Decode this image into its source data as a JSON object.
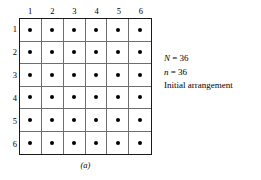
{
  "figure": {
    "caption": "(a)",
    "grid": {
      "rows": 6,
      "cols": 6,
      "column_headers": [
        "1",
        "2",
        "3",
        "4",
        "5",
        "6"
      ],
      "row_headers": [
        "1",
        "2",
        "3",
        "4",
        "5",
        "6"
      ],
      "cells": [
        [
          1,
          1,
          1,
          1,
          1,
          1
        ],
        [
          1,
          1,
          1,
          1,
          1,
          1
        ],
        [
          1,
          1,
          1,
          1,
          1,
          1
        ],
        [
          1,
          1,
          1,
          1,
          1,
          1
        ],
        [
          1,
          1,
          1,
          1,
          1,
          1
        ],
        [
          1,
          1,
          1,
          1,
          1,
          1
        ]
      ],
      "marker": "filled-dot",
      "marker_color": "#000000",
      "line_color": "#6e6e6e",
      "border_color": "#1a1a1a",
      "background": "#ffffff"
    },
    "annotations": [
      {
        "symbol": "N",
        "relation": " = ",
        "value": "36",
        "text": "N = 36"
      },
      {
        "symbol": "n",
        "relation": " = ",
        "value": "36",
        "text": "n = 36"
      },
      {
        "symbol": "",
        "relation": "",
        "value": "",
        "text": "Initial arrangement"
      }
    ]
  },
  "chart_data": {
    "type": "scatter",
    "title": "",
    "subtitle": "",
    "xlabel": "",
    "ylabel": "",
    "xticks": [
      "1",
      "2",
      "3",
      "4",
      "5",
      "6"
    ],
    "yticks": [
      "1",
      "2",
      "3",
      "4",
      "5",
      "6"
    ],
    "xlim": [
      0.5,
      6.5
    ],
    "ylim": [
      6.5,
      0.5
    ],
    "grid": true,
    "legend": "none",
    "points": [
      {
        "x": 1,
        "y": 1
      },
      {
        "x": 2,
        "y": 1
      },
      {
        "x": 3,
        "y": 1
      },
      {
        "x": 4,
        "y": 1
      },
      {
        "x": 5,
        "y": 1
      },
      {
        "x": 6,
        "y": 1
      },
      {
        "x": 1,
        "y": 2
      },
      {
        "x": 2,
        "y": 2
      },
      {
        "x": 3,
        "y": 2
      },
      {
        "x": 4,
        "y": 2
      },
      {
        "x": 5,
        "y": 2
      },
      {
        "x": 6,
        "y": 2
      },
      {
        "x": 1,
        "y": 3
      },
      {
        "x": 2,
        "y": 3
      },
      {
        "x": 3,
        "y": 3
      },
      {
        "x": 4,
        "y": 3
      },
      {
        "x": 5,
        "y": 3
      },
      {
        "x": 6,
        "y": 3
      },
      {
        "x": 1,
        "y": 4
      },
      {
        "x": 2,
        "y": 4
      },
      {
        "x": 3,
        "y": 4
      },
      {
        "x": 4,
        "y": 4
      },
      {
        "x": 5,
        "y": 4
      },
      {
        "x": 6,
        "y": 4
      },
      {
        "x": 1,
        "y": 5
      },
      {
        "x": 2,
        "y": 5
      },
      {
        "x": 3,
        "y": 5
      },
      {
        "x": 4,
        "y": 5
      },
      {
        "x": 5,
        "y": 5
      },
      {
        "x": 6,
        "y": 5
      },
      {
        "x": 1,
        "y": 6
      },
      {
        "x": 2,
        "y": 6
      },
      {
        "x": 3,
        "y": 6
      },
      {
        "x": 4,
        "y": 6
      },
      {
        "x": 5,
        "y": 6
      },
      {
        "x": 6,
        "y": 6
      }
    ],
    "total_points": 36,
    "annotations": [
      "N = 36",
      "n = 36",
      "Initial arrangement"
    ],
    "caption": "(a)"
  }
}
